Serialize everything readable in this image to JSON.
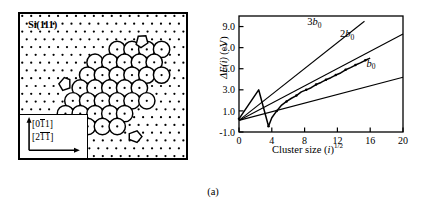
{
  "figure": {
    "caption": "(a)"
  },
  "left_panel": {
    "title": "Si(111)",
    "directions": [
      {
        "label": "[011]",
        "overbar_on": "second-char",
        "arrow": "up"
      },
      {
        "label": "[211]",
        "overbar_on": "second-and-third",
        "arrow": "right"
      }
    ],
    "direction_label_0_pre": "[0",
    "direction_label_0_bar": "1",
    "direction_label_0_post": "1]",
    "direction_label_1_pre": "[2",
    "direction_label_1_bar1": "1",
    "direction_label_1_bar2": "1",
    "direction_label_1_post": "]",
    "lattice": {
      "description": "Si(111) surface atom dot lattice with hexagonal island cluster of large open circles",
      "dot_color": "#000000",
      "cluster_fill": "#ffffff",
      "cluster_stroke": "#000000"
    }
  },
  "chart_data": {
    "type": "line",
    "title": "",
    "xlabel": "Cluster size (i)^1/2",
    "ylabel": "ΔE(i) (eV)",
    "xlim": [
      0,
      20
    ],
    "ylim": [
      -1.0,
      10.0
    ],
    "xticks": [
      0,
      4,
      8,
      12,
      16,
      20
    ],
    "xticklabels": [
      "0",
      "4",
      "8",
      "12",
      "16",
      "20"
    ],
    "yticks": [
      -1.0,
      1.0,
      3.0,
      5.0,
      7.0,
      9.0
    ],
    "yticklabels": [
      "-1.0",
      "1.0",
      "3.0",
      "5.0",
      "7.0",
      "9.0"
    ],
    "grid": false,
    "legend_position": "inline-annotations",
    "series": [
      {
        "name": "b_0",
        "label": "b0",
        "type": "line",
        "style": "solid",
        "slope": 0.205,
        "intercept": 0.1,
        "x": [
          0,
          20
        ],
        "values": [
          0.1,
          4.2
        ]
      },
      {
        "name": "2b_0",
        "label": "2b0",
        "type": "line",
        "style": "solid",
        "slope": 0.41,
        "intercept": 0.1,
        "x": [
          0,
          20
        ],
        "values": [
          0.1,
          8.3
        ]
      },
      {
        "name": "3b_0",
        "label": "3b0",
        "type": "line",
        "style": "solid",
        "slope": 0.615,
        "intercept": 0.1,
        "x": [
          0,
          15.3
        ],
        "values": [
          0.1,
          9.5
        ]
      },
      {
        "name": "data",
        "label": "",
        "type": "line-with-markers",
        "style": "solid-zigzag",
        "x": [
          0.0,
          2.4,
          3.6,
          4.0,
          4.6,
          5.2,
          5.8,
          6.4,
          7.0,
          7.6,
          8.2,
          8.8,
          9.4,
          10.0,
          10.6,
          11.2,
          11.8,
          12.4,
          13.0,
          13.6,
          14.2,
          14.8,
          15.4,
          16.0
        ],
        "values": [
          0.25,
          3.0,
          -0.45,
          0.35,
          1.0,
          1.55,
          1.9,
          2.2,
          2.45,
          2.8,
          3.0,
          3.2,
          3.5,
          3.7,
          3.95,
          4.15,
          4.4,
          4.6,
          4.9,
          5.1,
          5.35,
          5.55,
          5.8,
          6.0
        ]
      }
    ],
    "annotations": [
      {
        "text": "3b0",
        "x": 9.2,
        "y": 9.1
      },
      {
        "text": "2b0",
        "x": 13.2,
        "y": 8.0
      },
      {
        "text": "b0",
        "x": 16.1,
        "y": 5.2
      }
    ]
  }
}
